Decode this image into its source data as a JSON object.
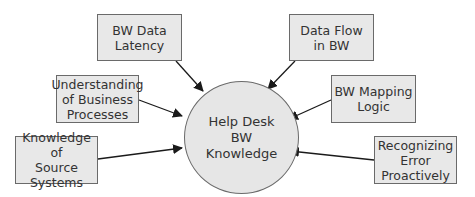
{
  "diagram": {
    "type": "hub-and-spoke",
    "hub": {
      "lines": [
        "Help Desk",
        "BW",
        "Knowledge"
      ]
    },
    "nodes": [
      {
        "id": "bw-data-latency",
        "lines": [
          "BW Data",
          "Latency"
        ]
      },
      {
        "id": "data-flow-in-bw",
        "lines": [
          "Data Flow",
          "in BW"
        ]
      },
      {
        "id": "understanding-business-processes",
        "lines": [
          "Understanding",
          "of Business",
          "Processes"
        ]
      },
      {
        "id": "bw-mapping-logic",
        "lines": [
          "BW Mapping",
          "Logic"
        ]
      },
      {
        "id": "knowledge-source-systems",
        "lines": [
          "Knowledge of",
          "Source",
          "Systems"
        ]
      },
      {
        "id": "recognizing-error-proactively",
        "lines": [
          "Recognizing",
          "Error",
          "Proactively"
        ]
      }
    ],
    "edges_direction": "node-to-hub",
    "colors": {
      "box_fill": "#e8e8e8",
      "hub_fill": "#e6e6e6",
      "stroke": "#6a6a6a",
      "arrow": "#1a1a1a",
      "text": "#333333"
    }
  }
}
